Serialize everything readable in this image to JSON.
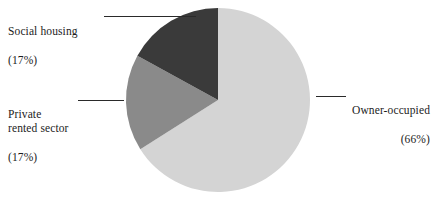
{
  "chart_data": {
    "type": "pie",
    "title": "",
    "subtitle": "",
    "xlabel": "",
    "ylabel": "",
    "legend_position": "callout-labels",
    "grid": false,
    "start_angle_deg": 0,
    "direction": "clockwise",
    "center": {
      "x": 218,
      "y": 100
    },
    "radius": 92,
    "categories": [
      "Owner-occupied",
      "Private rented sector",
      "Social housing"
    ],
    "values": [
      66,
      17,
      17
    ],
    "value_unit": "percent",
    "slices": [
      {
        "label": "Owner-occupied",
        "value": 66,
        "value_text": "(66%)",
        "color": "#d4d4d4",
        "start_deg": 0,
        "end_deg": 237.6
      },
      {
        "label": "Private rented sector",
        "value": 17,
        "value_text": "(17%)",
        "color": "#8a8a8a",
        "start_deg": 237.6,
        "end_deg": 298.8
      },
      {
        "label": "Social housing",
        "value": 17,
        "value_text": "(17%)",
        "color": "#3a3a3a",
        "start_deg": 298.8,
        "end_deg": 360
      }
    ]
  },
  "labels": {
    "social_housing": {
      "name": "Social housing",
      "value": "(17%)"
    },
    "private_rented": {
      "name": "Private\nrented sector",
      "value": "(17%)"
    },
    "owner_occupied": {
      "name": "Owner-occupied",
      "value": "(66%)"
    }
  },
  "colors": {
    "owner_occupied": "#d4d4d4",
    "private_rented": "#8a8a8a",
    "social_housing": "#3a3a3a",
    "leader_line": "#2a2a2a",
    "text": "#1c1c1c",
    "background": "#ffffff"
  }
}
